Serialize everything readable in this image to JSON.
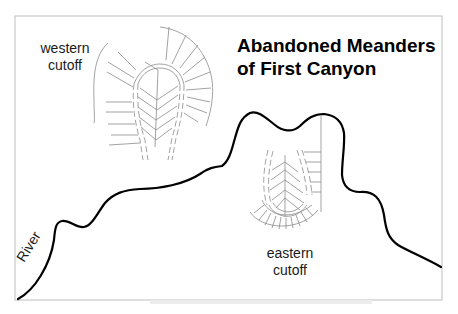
{
  "title": {
    "line1": "Abandoned Meanders",
    "line2": "of First Canyon"
  },
  "labels": {
    "western": {
      "line1": "western",
      "line2": "cutoff"
    },
    "eastern": {
      "line1": "eastern",
      "line2": "cutoff"
    },
    "river": "River"
  },
  "colors": {
    "river": "#000000",
    "contours": "#888888",
    "frame": "#bbbbbb",
    "background": "#ffffff"
  }
}
